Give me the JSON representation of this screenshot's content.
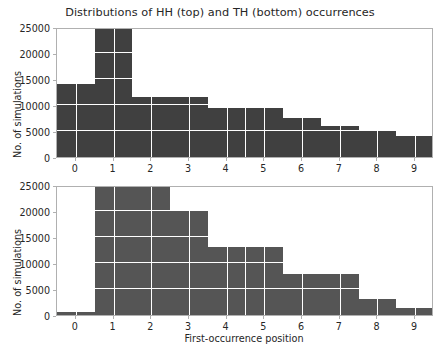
{
  "figure": {
    "title": "Distributions of HH (top) and TH (bottom) occurrences",
    "width": 440,
    "height": 352,
    "background": "#ffffff"
  },
  "chart_data": [
    {
      "id": "top",
      "type": "bar",
      "title": "Distributions of HH (top) and TH (bottom) occurrences",
      "subtitle": "HH occurrences",
      "xlabel": "",
      "ylabel": "No. of simulations",
      "categories": [
        "0",
        "1",
        "2",
        "3",
        "4",
        "5",
        "6",
        "7",
        "8",
        "9"
      ],
      "values": [
        14000,
        25000,
        11500,
        11500,
        9500,
        9500,
        7500,
        6000,
        5000,
        4000
      ],
      "xlim": [
        -0.5,
        9.5
      ],
      "ylim": [
        0,
        25000
      ],
      "xticks": [
        "0",
        "1",
        "2",
        "3",
        "4",
        "5",
        "6",
        "7",
        "8",
        "9"
      ],
      "yticks": [
        "0",
        "5000",
        "10000",
        "15000",
        "20000",
        "25000"
      ],
      "ytick_values": [
        0,
        5000,
        10000,
        15000,
        20000,
        25000
      ],
      "grid": true,
      "bar_color": "#404040",
      "grid_color": "#ffffff",
      "legend": null,
      "notes": "Bar at position 1 is clipped at the 25000 axis limit."
    },
    {
      "id": "bottom",
      "type": "bar",
      "title": "",
      "subtitle": "TH occurrences",
      "xlabel": "First-occurrence position",
      "ylabel": "No. of simulations",
      "categories": [
        "0",
        "1",
        "2",
        "3",
        "4",
        "5",
        "6",
        "7",
        "8",
        "9"
      ],
      "values": [
        600,
        25000,
        25000,
        20000,
        13000,
        13000,
        7800,
        7800,
        3000,
        1300
      ],
      "xlim": [
        -0.5,
        9.5
      ],
      "ylim": [
        0,
        25000
      ],
      "xticks": [
        "0",
        "1",
        "2",
        "3",
        "4",
        "5",
        "6",
        "7",
        "8",
        "9"
      ],
      "yticks": [
        "0",
        "5000",
        "10000",
        "15000",
        "20000",
        "25000"
      ],
      "ytick_values": [
        0,
        5000,
        10000,
        15000,
        20000,
        25000
      ],
      "grid": true,
      "bar_color": "#555555",
      "grid_color": "#ffffff",
      "legend": null,
      "notes": "Bars at positions 1 and 2 are clipped at the 25000 axis limit."
    }
  ],
  "axis_text": {
    "ylabel_top": "No. of simulations",
    "ylabel_bottom": "No. of simulations",
    "xlabel_bottom": "First-occurrence position"
  }
}
